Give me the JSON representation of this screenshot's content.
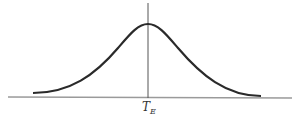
{
  "diagram": {
    "type": "bell-curve",
    "center_label": "T",
    "center_label_sub": "E",
    "colors": {
      "curve": "#2a2a2a",
      "axis": "#9a9a9a",
      "vline": "#555555",
      "background": "#ffffff"
    }
  }
}
